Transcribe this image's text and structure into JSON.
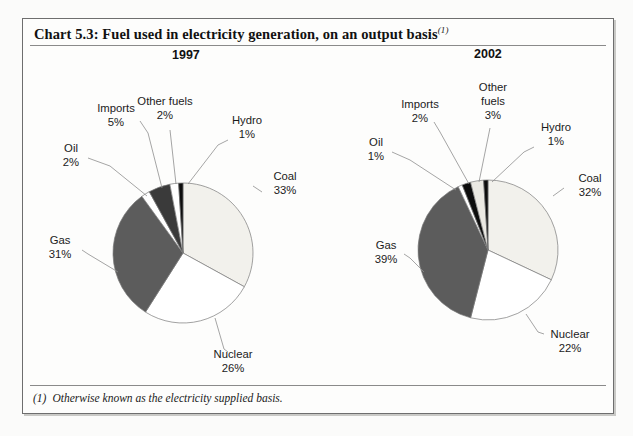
{
  "chart_title": "Chart 5.3: Fuel used in electricity generation, on an output basis",
  "title_footnote_mark": "(1)",
  "footnote": {
    "mark": "(1)",
    "text": "Otherwise known as the electricity supplied basis."
  },
  "panels": [
    {
      "year": "1997"
    },
    {
      "year": "2002"
    }
  ],
  "chart_data": [
    {
      "type": "pie",
      "title": "1997",
      "categories": [
        "Coal",
        "Nuclear",
        "Gas",
        "Oil",
        "Imports",
        "Other fuels",
        "Hydro"
      ],
      "values": [
        33,
        26,
        31,
        2,
        5,
        2,
        1
      ],
      "labels": [
        "Coal\n33%",
        "Nuclear\n26%",
        "Gas\n31%",
        "Oil\n2%",
        "Imports\n5%",
        "Other fuels\n2%",
        "Hydro\n1%"
      ],
      "unit": "%",
      "legend": "none",
      "slice_fills": [
        "#f2f1ec",
        "#ffffff",
        "#5c5c5c",
        "#ffffff",
        "#3a3a3a",
        "#ffffff",
        "#0d0d0d"
      ]
    },
    {
      "type": "pie",
      "title": "2002",
      "categories": [
        "Coal",
        "Nuclear",
        "Gas",
        "Oil",
        "Imports",
        "Other fuels",
        "Hydro"
      ],
      "values": [
        32,
        22,
        39,
        1,
        2,
        3,
        1
      ],
      "labels": [
        "Coal\n32%",
        "Nuclear\n22%",
        "Gas\n39%",
        "Oil\n1%",
        "Imports\n2%",
        "Other fuels\n3%",
        "Hydro\n1%"
      ],
      "unit": "%",
      "legend": "none",
      "slice_fills": [
        "#f2f1ec",
        "#ffffff",
        "#5c5c5c",
        "#ffffff",
        "#0d0d0d",
        "#ebe9e3",
        "#0d0d0d"
      ]
    }
  ],
  "labels_1997": {
    "coal_name": "Coal",
    "coal_value": "33%",
    "nuclear_name": "Nuclear",
    "nuclear_value": "26%",
    "gas_name": "Gas",
    "gas_value": "31%",
    "oil_name": "Oil",
    "oil_value": "2%",
    "imports_name": "Imports",
    "imports_value": "5%",
    "other_name": "Other fuels",
    "other_value": "2%",
    "hydro_name": "Hydro",
    "hydro_value": "1%"
  },
  "labels_2002": {
    "coal_name": "Coal",
    "coal_value": "32%",
    "nuclear_name": "Nuclear",
    "nuclear_value": "22%",
    "gas_name": "Gas",
    "gas_value": "39%",
    "oil_name": "Oil",
    "oil_value": "1%",
    "imports_name": "Imports",
    "imports_value": "2%",
    "other_name_line1": "Other",
    "other_name_line2": "fuels",
    "other_value": "3%",
    "hydro_name": "Hydro",
    "hydro_value": "1%"
  },
  "ghost_text": "",
  "colors": {
    "page_background": "#fdfdfc",
    "frame_border": "#6e6e6e",
    "text": "#1a1a1a",
    "coal_fill": "#f2f1ec",
    "nuclear_fill": "#ffffff",
    "gas_fill": "#5c5c5c",
    "dark_fill": "#0d0d0d",
    "imports_fill": "#3a3a3a"
  }
}
